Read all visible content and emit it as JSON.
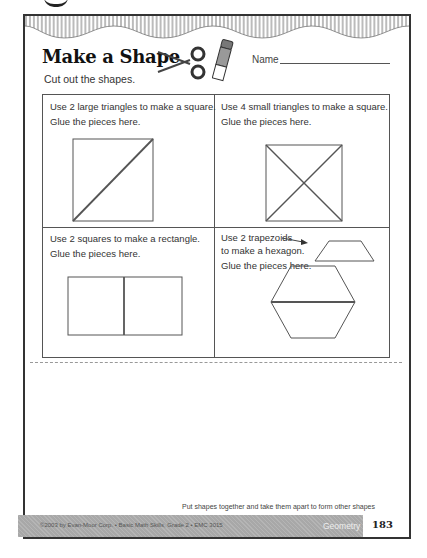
{
  "worksheet": {
    "title": "Make a Shape",
    "subtitle": "Cut out the shapes.",
    "name_label": "Name",
    "icons": [
      "scissors-icon",
      "glue-stick-icon"
    ]
  },
  "cells": [
    {
      "line1": "Use 2 large triangles to make a square.",
      "line2": "Glue the pieces here.",
      "diagram": "square-split-by-one-diagonal"
    },
    {
      "line1": "Use 4 small triangles to make a square.",
      "line2": "Glue the pieces here.",
      "diagram": "square-split-by-two-diagonals"
    },
    {
      "line1": "Use 2 squares to make a rectangle.",
      "line2": "Glue the pieces here.",
      "diagram": "rectangle-of-two-squares"
    },
    {
      "line1": "Use 2 trapezoids",
      "line1b": "to make a hexagon.",
      "line2": "Glue the pieces here.",
      "diagram": "hexagon-of-two-trapezoids"
    }
  ],
  "footer": {
    "caption": "Put shapes together and take them apart to form other shapes",
    "copyright": "©2003 by Evan-Moor Corp. • Basic Math Skills, Grade 2 • EMC 3015",
    "subject": "Geometry",
    "page_number": "183"
  },
  "colors": {
    "border": "#333333",
    "footer_bar": "#a8a8a8",
    "text": "#222222"
  }
}
